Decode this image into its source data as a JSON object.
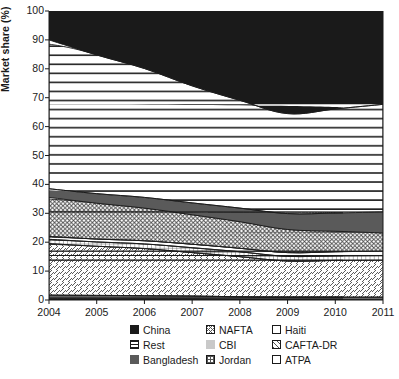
{
  "chart_data": {
    "type": "area",
    "stacked": true,
    "title": "",
    "xlabel": "",
    "ylabel": "Market share (%)",
    "ylim": [
      0,
      100
    ],
    "xlim": [
      2004,
      2011
    ],
    "yticks": [
      0,
      10,
      20,
      30,
      40,
      50,
      60,
      70,
      80,
      90,
      100
    ],
    "xticks": [
      "2004",
      "2005",
      "2006",
      "2007",
      "2008",
      "2009",
      "2010",
      "2011"
    ],
    "x": [
      2004,
      2005,
      2006,
      2007,
      2008,
      2009,
      2010,
      2011
    ],
    "grid": false,
    "legend_position": "bottom",
    "stack_order_bottom_to_top": [
      "ATPA",
      "CBI",
      "CAFTA-DR",
      "Jordan",
      "Haiti",
      "NAFTA",
      "Bangladesh",
      "Rest",
      "China"
    ],
    "series": [
      {
        "name": "ATPA",
        "pattern": "white",
        "color": "#ffffff",
        "values": [
          0.4,
          0.4,
          0.4,
          0.4,
          0.3,
          0.3,
          0.3,
          0.3
        ]
      },
      {
        "name": "CBI",
        "pattern": "solid-light",
        "color": "#c9c9c9",
        "values": [
          1.3,
          1.2,
          1.1,
          1.0,
          0.8,
          0.7,
          0.7,
          0.7
        ]
      },
      {
        "name": "CAFTA-DR",
        "pattern": "diagonal",
        "color": "#ffffff",
        "values": [
          17.8,
          17.0,
          16.3,
          15.0,
          13.9,
          12.5,
          12.7,
          12.8
        ]
      },
      {
        "name": "Jordan",
        "pattern": "grid",
        "color": "#ffffff",
        "values": [
          1.5,
          1.5,
          1.6,
          1.7,
          1.7,
          1.6,
          1.6,
          1.6
        ]
      },
      {
        "name": "Haiti",
        "pattern": "white",
        "color": "#ffffff",
        "values": [
          1.0,
          1.0,
          1.1,
          1.2,
          1.2,
          1.3,
          1.4,
          1.5
        ]
      },
      {
        "name": "NAFTA",
        "pattern": "crosshatch",
        "color": "#ffffff",
        "values": [
          13.5,
          12.4,
          11.3,
          10.2,
          9.2,
          8.0,
          7.1,
          6.3
        ]
      },
      {
        "name": "Bangladesh",
        "pattern": "solid-dark",
        "color": "#5a5a5a",
        "values": [
          3.0,
          3.3,
          3.7,
          4.1,
          4.7,
          5.5,
          6.3,
          7.3
        ]
      },
      {
        "name": "Rest",
        "pattern": "horizontal",
        "color": "#ffffff",
        "values": [
          51.5,
          48.0,
          44.6,
          40.5,
          37.3,
          34.6,
          36.0,
          37.2
        ]
      },
      {
        "name": "China",
        "pattern": "solid-black",
        "color": "#1a1a1a",
        "values": [
          10.0,
          15.2,
          19.9,
          25.9,
          30.9,
          35.5,
          33.9,
          32.3
        ]
      }
    ],
    "cumulative_tops": {
      "ATPA": [
        0.4,
        0.4,
        0.4,
        0.4,
        0.3,
        0.3,
        0.3,
        0.3
      ],
      "CBI": [
        1.7,
        1.6,
        1.5,
        1.4,
        1.1,
        1.0,
        1.0,
        1.0
      ],
      "CAFTA-DR": [
        19.5,
        18.6,
        17.8,
        16.4,
        15.0,
        13.5,
        13.7,
        13.8
      ],
      "Jordan": [
        21.0,
        20.1,
        19.4,
        18.1,
        16.7,
        15.1,
        15.3,
        15.4
      ],
      "Haiti": [
        22.0,
        21.1,
        20.5,
        19.3,
        17.9,
        16.4,
        16.7,
        16.9
      ],
      "NAFTA": [
        35.5,
        33.5,
        31.8,
        29.5,
        27.1,
        24.4,
        23.8,
        23.2
      ],
      "Bangladesh": [
        38.5,
        36.8,
        35.5,
        33.6,
        31.8,
        29.9,
        30.1,
        30.5
      ],
      "Rest": [
        90.0,
        84.8,
        80.1,
        74.1,
        69.1,
        64.5,
        66.1,
        67.7
      ],
      "China": [
        100,
        100,
        100,
        100,
        100,
        100,
        100,
        100
      ]
    }
  },
  "legend": {
    "rows": [
      [
        {
          "label": "China",
          "swatch": "sw-china"
        },
        {
          "label": "NAFTA",
          "swatch": "sw-nafta"
        },
        {
          "label": "Haiti",
          "swatch": "sw-white"
        }
      ],
      [
        {
          "label": "Rest",
          "swatch": "sw-rest"
        },
        {
          "label": "CBI",
          "swatch": "sw-cbi"
        },
        {
          "label": "CAFTA-DR",
          "swatch": "sw-cafta"
        }
      ],
      [
        {
          "label": "Bangladesh",
          "swatch": "sw-bang"
        },
        {
          "label": "Jordan",
          "swatch": "sw-jordan"
        },
        {
          "label": "ATPA",
          "swatch": "sw-white"
        }
      ]
    ]
  },
  "colors": {
    "china": "#1a1a1a",
    "bangladesh": "#5a5a5a",
    "cbi": "#c9c9c9",
    "axis": "#1a1a1a",
    "background": "#ffffff"
  }
}
